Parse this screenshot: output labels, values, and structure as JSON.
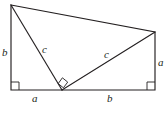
{
  "figure": {
    "background_color": "#ffffff",
    "stroke_color": "#231f20",
    "canvas": {
      "width": 168,
      "height": 119
    },
    "vertices": {
      "top_left": {
        "x": 11,
        "y": 5
      },
      "top_right": {
        "x": 155,
        "y": 32
      },
      "bottom_right": {
        "x": 155,
        "y": 90
      },
      "bottom_left": {
        "x": 11,
        "y": 90
      },
      "bottom_mid": {
        "x": 62,
        "y": 90
      }
    },
    "labels": [
      {
        "id": "left-leg-b",
        "text": "b",
        "x": 2,
        "y": 47
      },
      {
        "id": "left-hypotenuse-c",
        "text": "c",
        "x": 42,
        "y": 44
      },
      {
        "id": "right-hypotenuse-c",
        "text": "c",
        "x": 104,
        "y": 49
      },
      {
        "id": "right-leg-a",
        "text": "a",
        "x": 158,
        "y": 57
      },
      {
        "id": "bottom-left-a",
        "text": "a",
        "x": 32,
        "y": 93
      },
      {
        "id": "bottom-right-b",
        "text": "b",
        "x": 107,
        "y": 93
      }
    ],
    "right_angles": [
      {
        "id": "bottom-left-right-angle",
        "marker": "square"
      },
      {
        "id": "bottom-mid-right-angle",
        "marker": "rotated-square"
      },
      {
        "id": "bottom-right-right-angle",
        "marker": "square"
      }
    ],
    "segments": [
      {
        "id": "left-side",
        "label": "b",
        "from": "top_left",
        "to": "bottom_left"
      },
      {
        "id": "top-side",
        "label": "",
        "from": "top_left",
        "to": "top_right"
      },
      {
        "id": "right-side",
        "label": "a",
        "from": "top_right",
        "to": "bottom_right"
      },
      {
        "id": "bottom-left-side",
        "label": "a",
        "from": "bottom_left",
        "to": "bottom_mid"
      },
      {
        "id": "bottom-right-side",
        "label": "b",
        "from": "bottom_mid",
        "to": "bottom_right"
      },
      {
        "id": "left-cevian",
        "label": "c",
        "from": "top_left",
        "to": "bottom_mid"
      },
      {
        "id": "right-cevian",
        "label": "c",
        "from": "bottom_mid",
        "to": "top_right"
      }
    ]
  }
}
